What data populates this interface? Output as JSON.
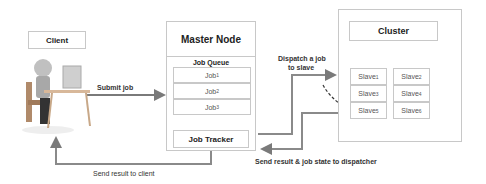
{
  "client": {
    "label": "Client",
    "icon": "person-at-computer-icon"
  },
  "master_node": {
    "title": "Master Node",
    "job_queue": {
      "label": "Job Queue",
      "jobs": [
        {
          "name": "Job",
          "sub": "1"
        },
        {
          "name": "Job",
          "sub": "2"
        },
        {
          "name": "Job",
          "sub": "3"
        }
      ]
    },
    "job_tracker": "Job Tracker"
  },
  "cluster": {
    "title": "Cluster",
    "slaves": [
      {
        "name": "Slave",
        "sub": "1"
      },
      {
        "name": "Slave",
        "sub": "2"
      },
      {
        "name": "Slave",
        "sub": "3"
      },
      {
        "name": "Slave",
        "sub": "4"
      },
      {
        "name": "Slave",
        "sub": "5"
      },
      {
        "name": "Slave",
        "sub": "6"
      }
    ]
  },
  "edges": {
    "submit_job": "Submit job",
    "dispatch_line1": "Dispatch a job",
    "dispatch_line2": "to slave",
    "send_result_dispatcher": "Send result & job state to dispatcher",
    "send_result_client": "Send result to client"
  },
  "colors": {
    "arrow": "#7a7a7a",
    "border": "#c8c8c8"
  }
}
